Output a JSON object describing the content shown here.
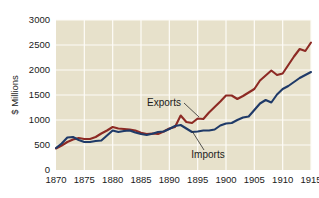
{
  "chart_data": {
    "type": "line",
    "title": "",
    "xlabel": "",
    "ylabel": "$ Millions",
    "xlim": [
      1870,
      1915
    ],
    "ylim": [
      0,
      3000
    ],
    "grid": true,
    "legend_position": "inline-annotations",
    "plot_background": "#e7e1cb",
    "gridline_color": "#fdfcf7",
    "x_ticks": [
      1870,
      1875,
      1880,
      1885,
      1890,
      1895,
      1900,
      1905,
      1910,
      1915
    ],
    "y_ticks": [
      0,
      500,
      1000,
      1500,
      2000,
      2500,
      3000
    ],
    "x": [
      1870,
      1871,
      1872,
      1873,
      1874,
      1875,
      1876,
      1877,
      1878,
      1879,
      1880,
      1881,
      1882,
      1883,
      1884,
      1885,
      1886,
      1887,
      1888,
      1889,
      1890,
      1891,
      1892,
      1893,
      1894,
      1895,
      1896,
      1897,
      1898,
      1899,
      1900,
      1901,
      1902,
      1903,
      1904,
      1905,
      1906,
      1907,
      1908,
      1909,
      1910,
      1911,
      1912,
      1913,
      1914,
      1915
    ],
    "series": [
      {
        "name": "Exports",
        "color": "#8d2a24",
        "values": [
          430,
          490,
          560,
          610,
          640,
          620,
          620,
          660,
          730,
          790,
          860,
          830,
          820,
          810,
          790,
          745,
          720,
          730,
          720,
          770,
          830,
          860,
          1090,
          960,
          940,
          1030,
          1020,
          1150,
          1260,
          1370,
          1490,
          1490,
          1420,
          1480,
          1550,
          1620,
          1790,
          1890,
          1990,
          1900,
          1930,
          2100,
          2270,
          2420,
          2380,
          2550
        ]
      },
      {
        "name": "Imports",
        "color": "#1f3a68",
        "values": [
          440,
          530,
          650,
          660,
          600,
          560,
          560,
          580,
          590,
          690,
          790,
          760,
          780,
          790,
          750,
          720,
          700,
          725,
          760,
          770,
          820,
          880,
          900,
          830,
          760,
          770,
          790,
          790,
          810,
          890,
          930,
          940,
          1000,
          1050,
          1070,
          1200,
          1330,
          1400,
          1350,
          1510,
          1620,
          1680,
          1760,
          1840,
          1900,
          1960
        ]
      }
    ],
    "annotations": [
      {
        "text": "Exports",
        "target_series": "Exports"
      },
      {
        "text": "Imports",
        "target_series": "Imports"
      }
    ]
  },
  "axis": {
    "y_title": "$ Millions"
  }
}
